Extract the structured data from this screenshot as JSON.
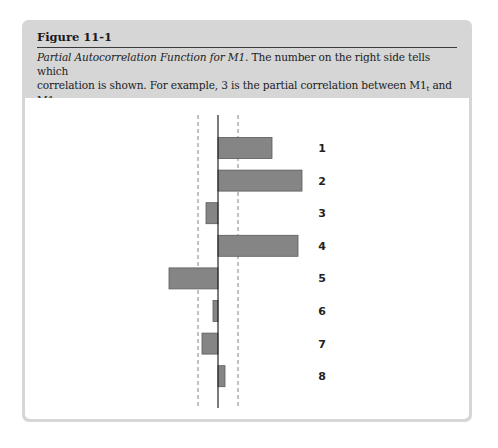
{
  "figure": {
    "number": "Figure 11-1",
    "caption_title": "Partial Autocorrelation Function for M1",
    "caption_line1_rest": ". The number on the right side tells which",
    "caption_line2_a": "correlation is shown. For example, 3 is the partial correlation between M1",
    "caption_sub_t": "t",
    "caption_line2_b": " and M1",
    "caption_sub_t3": "t−3",
    "caption_line2_c": ".",
    "caption_line3": "The dashed lines give the confidence interval for a 5% error level."
  },
  "colors": {
    "header_bg": "#d6d6d6",
    "bar_fill": "#858585",
    "axis": "#222222",
    "confidence_lines": "#777777"
  },
  "chart_data": {
    "type": "bar",
    "orientation": "horizontal",
    "title": "Partial Autocorrelation Function for M1",
    "xlabel": "",
    "ylabel": "",
    "categories": [
      "1",
      "2",
      "3",
      "4",
      "5",
      "6",
      "7",
      "8"
    ],
    "values": [
      0.54,
      0.84,
      -0.12,
      0.8,
      -0.49,
      -0.05,
      -0.16,
      0.07
    ],
    "confidence_interval": [
      -0.2,
      0.2
    ],
    "confidence_label": "5% error level",
    "xlim": [
      -0.55,
      0.9
    ],
    "grid": false,
    "legend": "none",
    "tick_labels_visible": false
  }
}
